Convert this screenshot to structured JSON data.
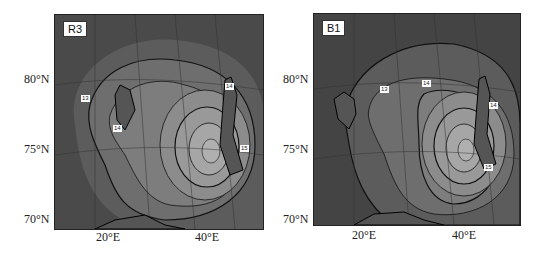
{
  "panels": [
    {
      "id": "R3",
      "label": "R3",
      "lat_labels": [
        "80°N",
        "75°N",
        "70°N"
      ],
      "lon_labels": [
        "20°E",
        "40°E"
      ],
      "contour_labels": [
        "13",
        "14",
        "14",
        "15"
      ]
    },
    {
      "id": "B1",
      "label": "B1",
      "lat_labels": [
        "80°N",
        "75°N",
        "70°N"
      ],
      "lon_labels": [
        "20°E",
        "40°E"
      ],
      "contour_labels": [
        "13",
        "14",
        "14",
        "15"
      ]
    }
  ],
  "colors": {
    "outer_shade": "#4a4a4a",
    "mid_shade": "#6e6e6e",
    "inner_shade": "#8c8c8c",
    "center_shade": "#a6a6a6",
    "contour": "#111111"
  }
}
